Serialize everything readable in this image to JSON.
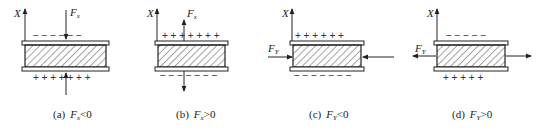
{
  "figure": {
    "axis_label": "X",
    "panels": [
      {
        "id": "a",
        "caption_prefix": "(a)",
        "force_symbol": "F",
        "force_subscript": "x",
        "relation": "<0",
        "force_label_symbol": "F",
        "force_label_subscript": "x",
        "top_charges": "− − − − − −",
        "bottom_charges": "+ + + + + + +",
        "force_direction": "compress-vertical"
      },
      {
        "id": "b",
        "caption_prefix": "(b)",
        "force_symbol": "F",
        "force_subscript": "x",
        "relation": ">0",
        "force_label_symbol": "F",
        "force_label_subscript": "x",
        "top_charges": "+ + + + + + +",
        "bottom_charges": "− − − − − − −",
        "force_direction": "tension-vertical"
      },
      {
        "id": "c",
        "caption_prefix": "(c)",
        "force_symbol": "F",
        "force_subscript": "Y",
        "relation": "<0",
        "force_label_symbol": "F",
        "force_label_subscript": "Y",
        "top_charges": "+ + + + + +",
        "bottom_charges": "− − − − − − −",
        "force_direction": "compress-horizontal"
      },
      {
        "id": "d",
        "caption_prefix": "(d)",
        "force_symbol": "F",
        "force_subscript": "Y",
        "relation": ">0",
        "force_label_symbol": "F",
        "force_label_subscript": "Y",
        "top_charges": "− − − − −",
        "bottom_charges": "+ + + + +",
        "force_direction": "tension-horizontal"
      }
    ],
    "colors": {
      "stroke": "#222222",
      "hatch": "#333333",
      "background": "#ffffff"
    }
  }
}
